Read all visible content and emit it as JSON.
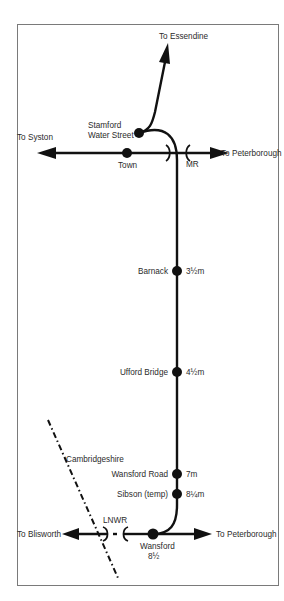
{
  "diagram": {
    "colors": {
      "track": "#111111",
      "frame": "#7a7a7a",
      "text": "#2b2b2b",
      "background": "#ffffff"
    },
    "destinations": {
      "north": "To Essendine",
      "west_top": "To Syston",
      "east_top": "To Peterborough",
      "west_bottom": "To Blisworth",
      "east_bottom": "To Peterborough"
    },
    "companies": {
      "top_junction": "MR",
      "bottom_junction": "LNWR"
    },
    "region_label": "Cambridgeshire",
    "stations": [
      {
        "name_line1": "Stamford",
        "name_line2": "Water Street",
        "distance": ""
      },
      {
        "name_line1": "Town",
        "name_line2": "",
        "distance": ""
      },
      {
        "name_line1": "Barnack",
        "name_line2": "",
        "distance": "3½m"
      },
      {
        "name_line1": "Ufford Bridge",
        "name_line2": "",
        "distance": "4½m"
      },
      {
        "name_line1": "Wansford Road",
        "name_line2": "",
        "distance": "7m"
      },
      {
        "name_line1": "Sibson (temp)",
        "name_line2": "",
        "distance": "8¼m"
      },
      {
        "name_line1": "Wansford",
        "name_line2": "",
        "distance": "8½"
      }
    ]
  }
}
